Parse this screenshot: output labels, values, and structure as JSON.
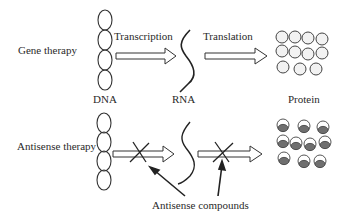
{
  "rows": {
    "gene": {
      "label": "Gene therapy"
    },
    "antisense": {
      "label": "Antisense therapy"
    }
  },
  "steps": {
    "transcription": "Transcription",
    "translation": "Translation"
  },
  "molecules": {
    "dna": "DNA",
    "rna": "RNA",
    "protein": "Protein"
  },
  "annotation": {
    "antisense_compounds": "Antisense compounds"
  },
  "colors": {
    "stroke": "#333333",
    "protein_fill_dark": "#6f6f6f",
    "protein_fill_light": "#e6e6e6"
  }
}
